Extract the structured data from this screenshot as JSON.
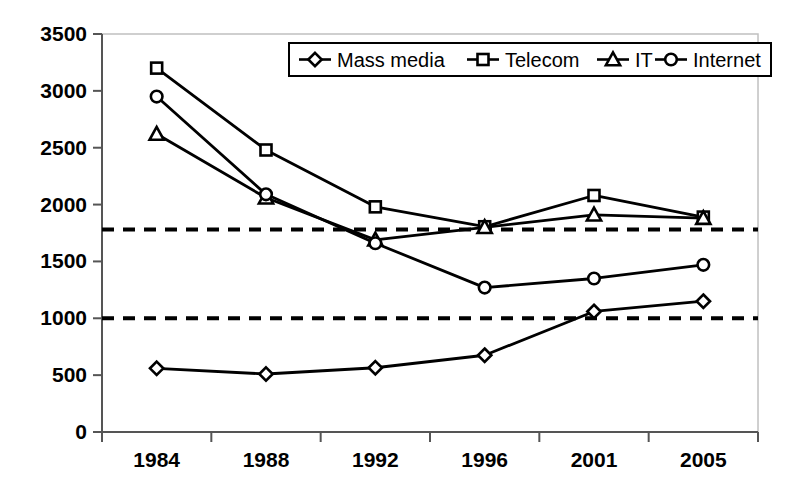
{
  "chart_data": {
    "type": "line",
    "title": "",
    "xlabel": "",
    "ylabel": "",
    "categories": [
      "1984",
      "1988",
      "1992",
      "1996",
      "2001",
      "2005"
    ],
    "ylim": [
      0,
      3500
    ],
    "ytick_step": 500,
    "yticks": [
      "0",
      "500",
      "1000",
      "1500",
      "2000",
      "2500",
      "3000",
      "3500"
    ],
    "grid": false,
    "legend_position": "top-center-inside",
    "series": [
      {
        "name": "Mass media",
        "marker": "diamond",
        "values": [
          560,
          510,
          565,
          675,
          1060,
          1150
        ]
      },
      {
        "name": "Telecom",
        "marker": "square",
        "values": [
          3200,
          2480,
          1980,
          1805,
          2080,
          1890
        ]
      },
      {
        "name": "IT",
        "marker": "triangle",
        "values": [
          2620,
          2060,
          1690,
          1800,
          1910,
          1880
        ]
      },
      {
        "name": "Internet",
        "marker": "circle",
        "values": [
          2950,
          2090,
          1660,
          1270,
          1350,
          1470
        ]
      }
    ],
    "reference_lines": [
      {
        "name": "upper-threshold",
        "value": 1780,
        "style": "dashed"
      },
      {
        "name": "lower-threshold",
        "value": 1000,
        "style": "dashed"
      }
    ]
  },
  "legend": {
    "entries": [
      {
        "label": "Mass media",
        "marker": "diamond"
      },
      {
        "label": "Telecom",
        "marker": "square"
      },
      {
        "label": "IT",
        "marker": "triangle"
      },
      {
        "label": "Internet",
        "marker": "circle"
      }
    ]
  },
  "colors": {
    "line": "#000000",
    "axis": "#555555",
    "plot_border": "#bbbbbb",
    "background": "#ffffff"
  }
}
